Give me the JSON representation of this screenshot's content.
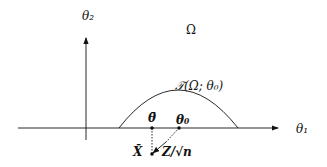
{
  "labels": {
    "y_axis": "θ₂",
    "x_axis": "θ₁",
    "region": "Ω",
    "tangent_cone": "𝒯(Ω; θ₀)",
    "theta_bar": "θ̄",
    "theta0": "θ₀",
    "x_bar": "X̄",
    "z_scaled": "Z/√n"
  },
  "colors": {
    "stroke": "#111111",
    "background": "#ffffff"
  }
}
